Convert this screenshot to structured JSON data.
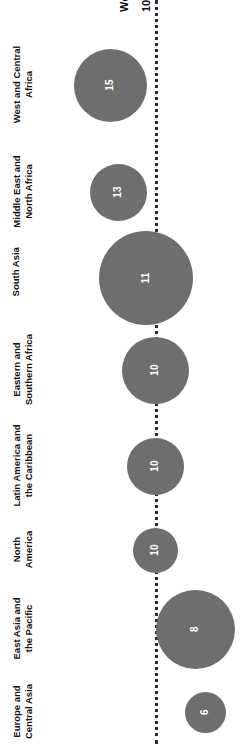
{
  "chart_data": {
    "type": "bar",
    "subtype": "bubble",
    "orientation": "rotated-90",
    "title": "",
    "xlabel": "",
    "ylabel": "",
    "categories": [
      "West and Central\nAfrica",
      "Middle East and\nNorth Africa",
      "South Asia",
      "Eastern and\nSouthern Africa",
      "Latin America and\nthe Caribbean",
      "North\nAmerica",
      "East Asia and\nthe Pacific",
      "Europe and\nCentral Asia"
    ],
    "values": [
      15,
      13,
      11,
      10,
      10,
      10,
      8,
      6
    ],
    "reference": {
      "label": "World",
      "value": "10",
      "style": "dotted-line"
    },
    "grid": false,
    "legend": false,
    "colors": {
      "bubble_fill": "#6e6e6e",
      "value_text": "#ffffff",
      "category_text": "#111111",
      "reference_line": "#2b2b2b",
      "background": "#ffffff"
    }
  },
  "bubbles": [
    {
      "name": "west-and-central-africa",
      "value": "15",
      "cx": 110,
      "cy": 85,
      "d": 73
    },
    {
      "name": "middle-east-and-north-africa",
      "value": "13",
      "cx": 118,
      "cy": 192,
      "d": 57
    },
    {
      "name": "south-asia",
      "value": "11",
      "cx": 146,
      "cy": 278,
      "d": 94
    },
    {
      "name": "eastern-and-southern-africa",
      "value": "10",
      "cx": 155,
      "cy": 370,
      "d": 67
    },
    {
      "name": "latin-america-and-the-caribbean",
      "value": "10",
      "cx": 155,
      "cy": 466,
      "d": 57
    },
    {
      "name": "north-america",
      "value": "10",
      "cx": 155,
      "cy": 550,
      "d": 45
    },
    {
      "name": "east-asia-and-the-pacific",
      "value": "8",
      "cx": 195,
      "cy": 629,
      "d": 79
    },
    {
      "name": "europe-and-central-asia",
      "value": "6",
      "cx": 205,
      "cy": 712,
      "d": 41
    }
  ],
  "category_labels": [
    {
      "text": "West and Central\nAfrica",
      "cy": 85,
      "cx": 22
    },
    {
      "text": "Middle East and\nNorth Africa",
      "cy": 192,
      "cx": 22
    },
    {
      "text": "South Asia",
      "cy": 278,
      "cx": 16
    },
    {
      "text": "Eastern and\nSouthern Africa",
      "cy": 370,
      "cx": 22
    },
    {
      "text": "Latin America and\nthe Caribbean",
      "cy": 466,
      "cx": 22
    },
    {
      "text": "North\nAmerica",
      "cy": 550,
      "cx": 22
    },
    {
      "text": "East Asia and\nthe Pacific",
      "cy": 629,
      "cx": 22
    },
    {
      "text": "Europe and\nCentral Asia",
      "cy": 712,
      "cx": 22
    }
  ],
  "reference_line": {
    "x": 155,
    "name_label": "World",
    "value_label": "10"
  }
}
